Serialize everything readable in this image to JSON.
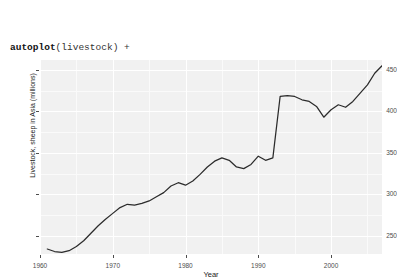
{
  "code": {
    "ghost_line": "  geom_line(colour = \"black\")",
    "line1": {
      "fn": "autoplot",
      "open": "(",
      "arg": "livestock",
      "close": ")",
      "plus": " +"
    },
    "line2": {
      "fn1": "xlab",
      "open1": "(",
      "str1": "\"Year\"",
      "close1": ")",
      "plus": " + ",
      "fn2": "ylab",
      "open2": "(",
      "str2": "\"Livestock, sheep in Asia (millions)\"",
      "close2": ")"
    }
  },
  "chart_data": {
    "type": "line",
    "title": "",
    "xlabel": "Year",
    "ylabel": "Livestock, sheep in Asia (millions)",
    "xlim": [
      1960,
      2007
    ],
    "ylim": [
      228,
      462
    ],
    "xticks": [
      1960,
      1970,
      1980,
      1990,
      2000
    ],
    "yticks": [
      250,
      300,
      350,
      400,
      450
    ],
    "grid": true,
    "legend": "none",
    "line_color": "#2b2b2b",
    "panel_color": "#f1f1f1",
    "gridline_color": "#ffffff",
    "series": [
      {
        "name": "Livestock, sheep in Asia",
        "x": [
          1961,
          1962,
          1963,
          1964,
          1965,
          1966,
          1967,
          1968,
          1969,
          1970,
          1971,
          1972,
          1973,
          1974,
          1975,
          1976,
          1977,
          1978,
          1979,
          1980,
          1981,
          1982,
          1983,
          1984,
          1985,
          1986,
          1987,
          1988,
          1989,
          1990,
          1991,
          1992,
          1993,
          1994,
          1995,
          1996,
          1997,
          1998,
          1999,
          2000,
          2001,
          2002,
          2003,
          2004,
          2005,
          2006,
          2007
        ],
        "values": [
          234,
          231,
          230,
          232,
          237,
          244,
          253,
          262,
          270,
          277,
          284,
          288,
          287,
          289,
          292,
          297,
          302,
          310,
          314,
          311,
          316,
          324,
          333,
          340,
          344,
          341,
          333,
          331,
          336,
          346,
          341,
          344,
          418,
          419,
          418,
          414,
          412,
          406,
          393,
          402,
          408,
          405,
          412,
          422,
          432,
          446,
          455
        ]
      }
    ]
  },
  "axes": {
    "y_ticks": [
      {
        "label": "450",
        "value": 450
      },
      {
        "label": "400",
        "value": 400
      },
      {
        "label": "350",
        "value": 350
      },
      {
        "label": "300",
        "value": 300
      },
      {
        "label": "250",
        "value": 250
      }
    ],
    "x_ticks": [
      {
        "label": "1960",
        "value": 1960
      },
      {
        "label": "1970",
        "value": 1970
      },
      {
        "label": "1980",
        "value": 1980
      },
      {
        "label": "1990",
        "value": 1990
      },
      {
        "label": "2000",
        "value": 2000
      }
    ]
  }
}
